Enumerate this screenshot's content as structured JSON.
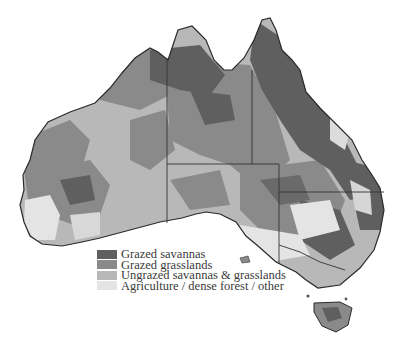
{
  "map": {
    "subject": "Australia land use / grazing map",
    "legend": {
      "items": [
        {
          "label": "Grazed savannas",
          "color": "#5f5f5f"
        },
        {
          "label": "Grazed grasslands",
          "color": "#8a8a8a"
        },
        {
          "label": "Ungrazed savannas & grasslands",
          "color": "#b8b8b8"
        },
        {
          "label": "Agriculture / dense forest / other",
          "color": "#e4e4e4"
        }
      ]
    },
    "colors": {
      "background": "#ffffff",
      "border_line": "#333333",
      "coastline": "#2a2a2a"
    }
  }
}
